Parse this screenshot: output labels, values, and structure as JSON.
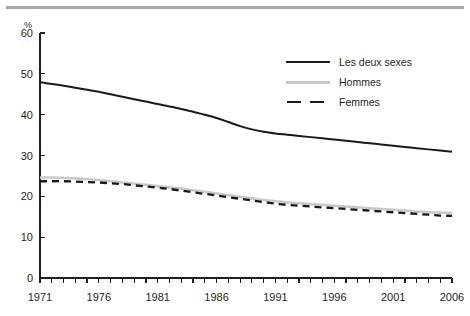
{
  "figure": {
    "top_rule": "horizontal-rule",
    "background": "#ffffff"
  },
  "axis": {
    "y_unit_label": "%",
    "y_ticks": [
      "60",
      "50",
      "40",
      "30",
      "20",
      "10",
      "0"
    ],
    "x_ticks": [
      "1971",
      "1976",
      "1981",
      "1986",
      "1991",
      "1996",
      "2001",
      "2006"
    ]
  },
  "legend": {
    "items": [
      {
        "label": "Les deux sexes",
        "style": "solid",
        "color": "#1a1a1a"
      },
      {
        "label": "Hommes",
        "style": "solid",
        "color": "#c9c9c9"
      },
      {
        "label": "Femmes",
        "style": "dashed",
        "color": "#1a1a1a"
      }
    ]
  },
  "colors": {
    "both_sexes": "#1a1a1a",
    "men": "#c9c9c9",
    "women": "#1a1a1a",
    "rule": "#a6a6a6",
    "axis": "#231f20"
  },
  "chart_data": {
    "type": "line",
    "title": "",
    "xlabel": "",
    "ylabel": "%",
    "xlim": [
      1971,
      2006
    ],
    "ylim": [
      0,
      60
    ],
    "ytick_step": 10,
    "xtick_step": 5,
    "minor_xticks": "annual",
    "grid": false,
    "legend_position": "top-right",
    "x": [
      1971,
      1972,
      1973,
      1974,
      1975,
      1976,
      1977,
      1978,
      1979,
      1980,
      1981,
      1982,
      1983,
      1984,
      1985,
      1986,
      1987,
      1988,
      1989,
      1990,
      1991,
      1992,
      1993,
      1994,
      1995,
      1996,
      1997,
      1998,
      1999,
      2000,
      2001,
      2002,
      2003,
      2004,
      2005,
      2006
    ],
    "series": [
      {
        "name": "Les deux sexes",
        "style": "solid",
        "color": "#1a1a1a",
        "values": [
          48.0,
          47.5,
          47.1,
          46.6,
          46.1,
          45.6,
          45.0,
          44.4,
          43.8,
          43.2,
          42.6,
          42.0,
          41.4,
          40.7,
          40.0,
          39.2,
          38.2,
          37.2,
          36.4,
          35.8,
          35.4,
          35.1,
          34.8,
          34.5,
          34.2,
          33.9,
          33.6,
          33.3,
          33.0,
          32.7,
          32.4,
          32.1,
          31.8,
          31.5,
          31.2,
          30.9
        ]
      },
      {
        "name": "Hommes",
        "style": "solid",
        "color": "#c9c9c9",
        "values": [
          24.6,
          24.6,
          24.5,
          24.4,
          24.2,
          24.0,
          23.7,
          23.4,
          23.1,
          22.8,
          22.5,
          22.2,
          21.9,
          21.5,
          21.1,
          20.7,
          20.3,
          19.9,
          19.5,
          19.1,
          18.8,
          18.5,
          18.3,
          18.1,
          17.9,
          17.7,
          17.5,
          17.3,
          17.1,
          16.9,
          16.7,
          16.5,
          16.3,
          16.1,
          16.0,
          15.9
        ]
      },
      {
        "name": "Femmes",
        "style": "dashed",
        "color": "#1a1a1a",
        "values": [
          23.7,
          23.7,
          23.7,
          23.6,
          23.5,
          23.4,
          23.2,
          23.0,
          22.7,
          22.4,
          22.1,
          21.8,
          21.4,
          21.0,
          20.6,
          20.2,
          19.8,
          19.4,
          19.0,
          18.6,
          18.2,
          17.9,
          17.7,
          17.5,
          17.3,
          17.1,
          16.9,
          16.7,
          16.5,
          16.3,
          16.1,
          15.9,
          15.7,
          15.5,
          15.3,
          15.2
        ]
      }
    ]
  },
  "plot_geometry": {
    "left": 40,
    "right": 452,
    "top": 33,
    "bottom": 278
  }
}
